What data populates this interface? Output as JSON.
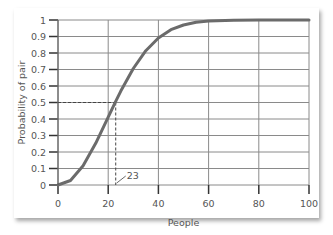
{
  "chart_data": {
    "type": "line",
    "title": "",
    "xlabel": "People",
    "ylabel": "Probability of pair",
    "xlim": [
      0,
      100
    ],
    "ylim": [
      0,
      1
    ],
    "x_ticks": [
      "0",
      "20",
      "40",
      "60",
      "80",
      "100"
    ],
    "y_ticks": [
      "0",
      "0.1",
      "0.2",
      "0.3",
      "0.4",
      "0.5",
      "0.6",
      "0.7",
      "0.8",
      "0.9",
      "1"
    ],
    "grid": true,
    "series": [
      {
        "name": "Probability of shared birthday",
        "x": [
          0,
          5,
          10,
          15,
          20,
          23,
          25,
          30,
          35,
          40,
          45,
          50,
          55,
          60,
          70,
          80,
          100
        ],
        "values": [
          0,
          0.027,
          0.117,
          0.253,
          0.411,
          0.507,
          0.569,
          0.706,
          0.814,
          0.891,
          0.941,
          0.97,
          0.986,
          0.994,
          0.999,
          1.0,
          1.0
        ]
      }
    ],
    "annotations": [
      {
        "label": "23",
        "x": 23,
        "y": 0.5,
        "style": "dashed guide lines"
      }
    ],
    "colors": {
      "line": "#6b6b6b",
      "grid": "#8a8a8a",
      "text": "#555555"
    }
  }
}
